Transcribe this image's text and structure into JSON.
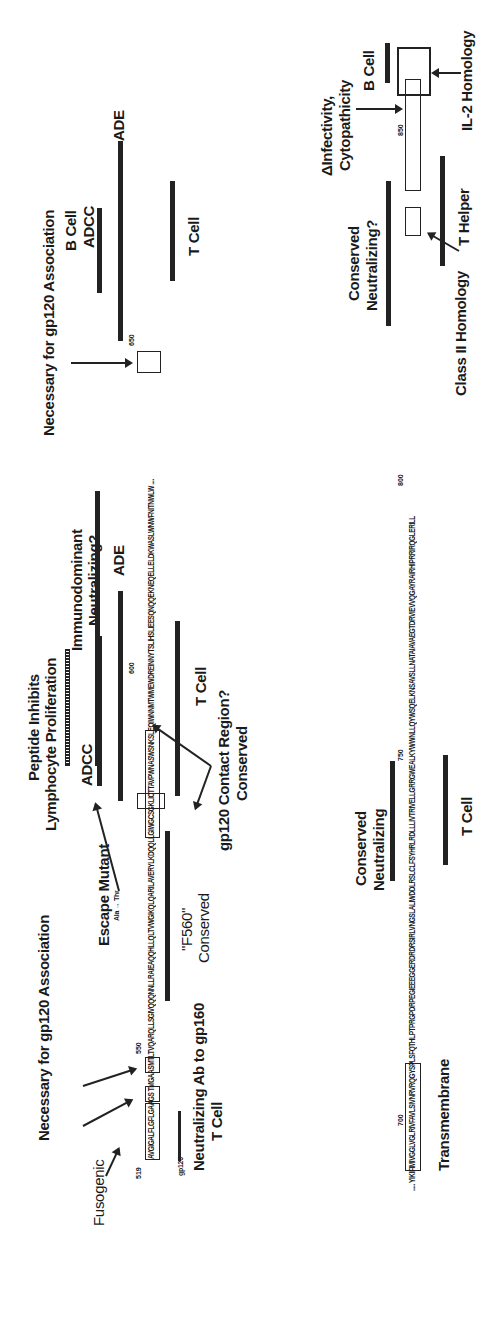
{
  "figure": {
    "orientation": "rotated-90-ccw",
    "row1": {
      "sequence_segments": [
        {
          "text": "AVGIGALF",
          "boxed": true
        },
        {
          "text": "LGFLGAAGS",
          "boxed": true
        },
        {
          "text": "TMG",
          "boxed": true
        },
        {
          "text": "AASM",
          "boxed": false
        },
        {
          "text": "TLT",
          "boxed": true
        },
        {
          "text": "VQARQLLSGIVQQQNNLLRAIEAQQHLLQLTVWG",
          "boxed": false
        },
        {
          "text": "IKQLQARIL",
          "boxed": true
        },
        {
          "text": "AVERYLKDQQLLGIWG",
          "boxed": true
        },
        {
          "text": "CSGKLICTTAVPWNASWSNKSLEQIWNNMTWMEWDREINNY",
          "boxed": false
        },
        {
          "text": "TSL",
          "boxed": true
        },
        {
          "text": "IHSLIEESQNQQEKNEQELLELDKWASLWNWFNITNWLW ....",
          "boxed": false
        }
      ],
      "residue_numbers": [
        "519",
        "550",
        "600",
        "650"
      ],
      "annotations": {
        "fusogenic": "Fusogenic",
        "gp120_assoc_1": "Necessary for gp120 Association",
        "gp120_marker": "gp120",
        "neutralizing_ab": "Neutralizing Ab to gp160",
        "t_cell_1": "T Cell",
        "escape_mutant": "Escape Mutant",
        "escape_mutant_sub": "Ala → Thr",
        "f560": "\"F560\"",
        "f560_conserved": "Conserved",
        "peptide_inhibits": "Peptide Inhibits",
        "lymphocyte_prolif": "Lymphocyte Proliferation",
        "adcc_1": "ADCC",
        "contact_region": "gp120 Contact Region?",
        "contact_conserved": "Conserved",
        "immunodominant": "Immunodominant",
        "neutralizing_q": "Neutralizing?",
        "ade_1": "ADE",
        "t_cell_2": "T Cell",
        "gp120_assoc_2": "Necessary for gp120 Association",
        "b_cell_1": "B Cell",
        "adcc_2": "ADCC",
        "ade_2": "ADE",
        "t_cell_3": "T Cell"
      }
    },
    "row2": {
      "sequence_segments": [
        {
          "text": "..... YIK",
          "boxed": false
        },
        {
          "text": "IFIMIVGGLVGLRIVFAVLSI",
          "boxed": true
        },
        {
          "text": "VNRVRQGYSPLSFQTHLPTPRGPDRPEGIEEEGGERDRDRSIRLVNGSLALIWDDLRSLCLFSYHRLRDLLLIVTRIVELLGRRGWEALKYWWNLLQYWSQELKNSAVSLLNATAIAVA",
          "boxed": false
        },
        {
          "text": "EGTDRV",
          "boxed": true
        },
        {
          "text": "IEV",
          "boxed": false
        },
        {
          "text": "VQGAYRAIRHIPRRIRQG",
          "boxed": true
        },
        {
          "text": "LERILL",
          "boxed": true
        }
      ],
      "residue_numbers": [
        "700",
        "750",
        "800",
        "850"
      ],
      "annotations": {
        "transmembrane": "Transmembrane",
        "conserved_1": "Conserved",
        "neutralizing_1": "Neutralizing",
        "t_cell": "T Cell",
        "class2": "Class II Homology",
        "conserved_2": "Conserved",
        "neutralizing_2": "Neutralizing?",
        "t_helper": "T Helper",
        "infectivity": "ΔInfectivity,",
        "cytopathicity": "Cytopathicity",
        "b_cell": "B Cell",
        "il2": "IL-2 Homology"
      }
    }
  }
}
